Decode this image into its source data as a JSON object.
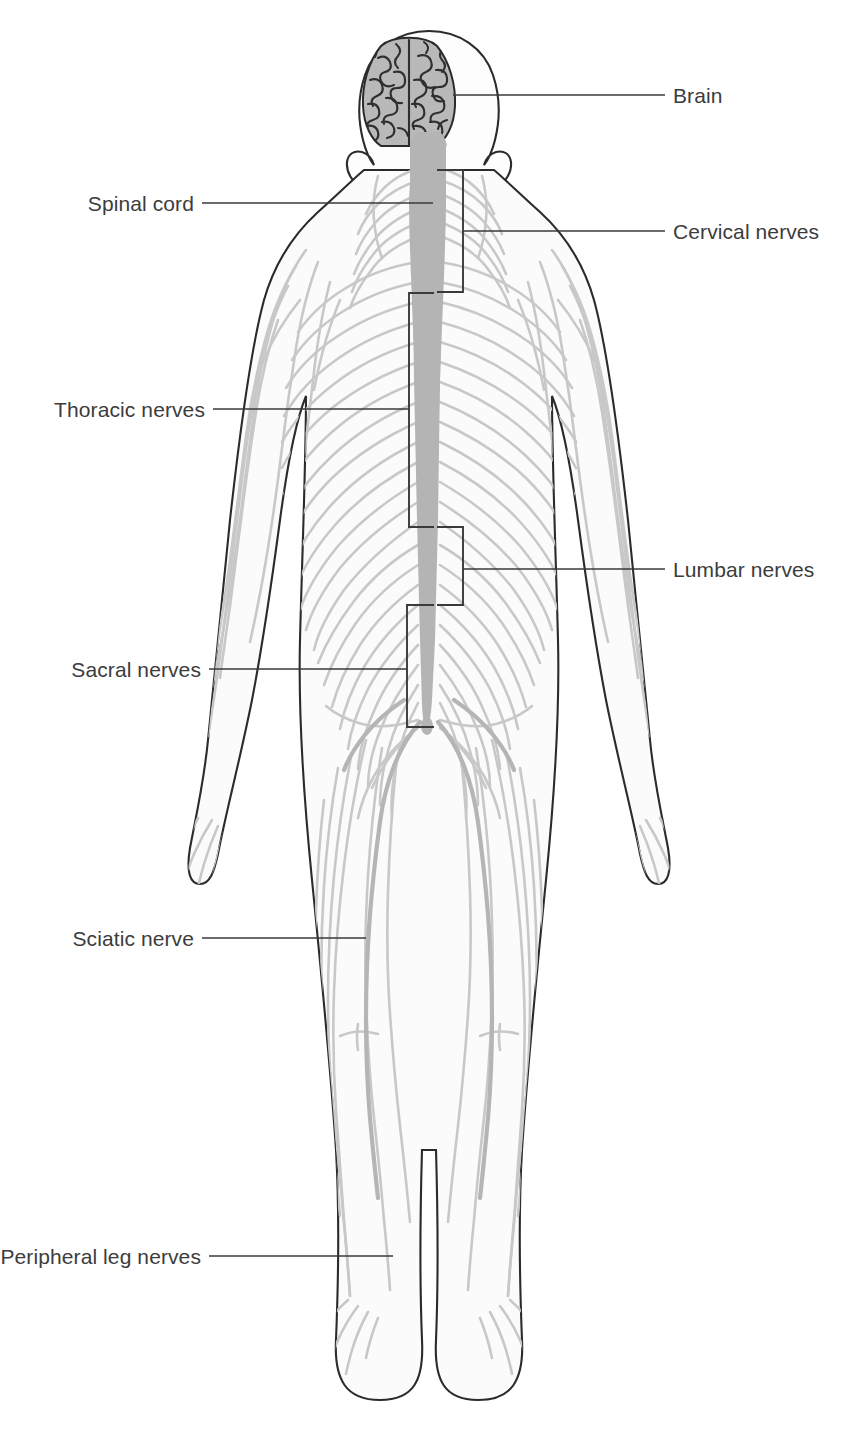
{
  "diagram": {
    "view": "posterior",
    "colors": {
      "outline": "#2b2b2b",
      "nerve": "#c3c3c3",
      "nerve_dark": "#b0b0b0",
      "cord": "#b4b4b4",
      "brain_fill": "#b9b9b9",
      "brain_gyri": "#2f2f2f",
      "body_fill": "#fbfbfb",
      "leader_line": "#3a3a3a",
      "label_text": "#3c3c3c",
      "background": "#ffffff"
    },
    "labels": [
      {
        "id": "brain",
        "text": "Brain",
        "side": "right",
        "text_x": 673,
        "text_y": 95,
        "line_from_x": 673,
        "line_to_x": 453,
        "line_y": 95
      },
      {
        "id": "cervical-nerves",
        "text": "Cervical nerves",
        "side": "right",
        "text_x": 673,
        "text_y": 231,
        "line_from_x": 673,
        "line_to_x": 463,
        "line_y": 231
      },
      {
        "id": "lumbar-nerves",
        "text": "Lumbar nerves",
        "side": "right",
        "text_x": 673,
        "text_y": 569,
        "line_from_x": 673,
        "line_to_x": 463,
        "line_y": 569
      },
      {
        "id": "spinal-cord",
        "text": "Spinal cord",
        "side": "left",
        "text_x": 190,
        "text_y": 203,
        "line_from_x": 202,
        "line_to_x": 433,
        "line_y": 203
      },
      {
        "id": "thoracic-nerves",
        "text": "Thoracic nerves",
        "side": "left",
        "text_x": 202,
        "text_y": 409,
        "line_from_x": 213,
        "line_to_x": 409,
        "line_y": 409
      },
      {
        "id": "sacral-nerves",
        "text": "Sacral nerves",
        "side": "left",
        "text_x": 197,
        "text_y": 669,
        "line_from_x": 209,
        "line_to_x": 407,
        "line_y": 669
      },
      {
        "id": "sciatic-nerve",
        "text": "Sciatic nerve",
        "side": "left",
        "text_x": 190,
        "text_y": 938,
        "line_from_x": 202,
        "line_to_x": 366,
        "line_y": 938
      },
      {
        "id": "peripheral-leg-nerves",
        "text": "Peripheral leg nerves",
        "side": "left",
        "text_x": 197,
        "text_y": 1256,
        "line_from_x": 209,
        "line_to_x": 393,
        "line_y": 1256
      }
    ],
    "brackets": [
      {
        "id": "cervical-bracket",
        "side": "right",
        "top": 170,
        "bottom": 292,
        "edge_x": 463,
        "stem_x": 437
      },
      {
        "id": "thoracic-bracket",
        "side": "left",
        "top": 293,
        "bottom": 527,
        "edge_x": 409,
        "stem_x": 434
      },
      {
        "id": "lumbar-bracket",
        "side": "right",
        "top": 527,
        "bottom": 605,
        "edge_x": 463,
        "stem_x": 437
      },
      {
        "id": "sacral-bracket",
        "side": "left",
        "top": 605,
        "bottom": 727,
        "edge_x": 407,
        "stem_x": 434
      }
    ],
    "regions": [
      {
        "id": "head",
        "name": "head-and-brain"
      },
      {
        "id": "torso",
        "name": "torso-with-spinal-nerves"
      },
      {
        "id": "arms",
        "name": "arms-with-peripheral-nerves"
      },
      {
        "id": "legs",
        "name": "legs-with-sciatic-and-peripheral-nerves"
      }
    ]
  }
}
